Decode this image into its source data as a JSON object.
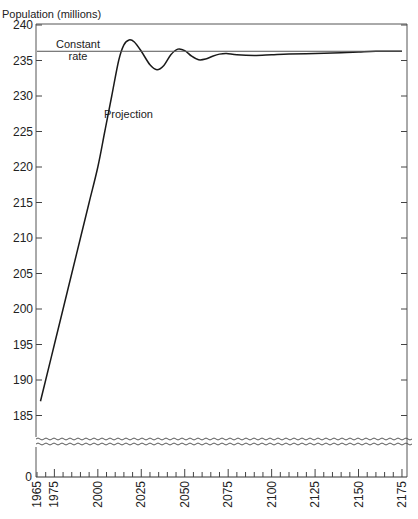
{
  "chart_data": {
    "type": "line",
    "title": "",
    "xlabel": "",
    "ylabel": "Population (millions)",
    "xlim": [
      1965,
      2180
    ],
    "ylim": [
      183,
      240
    ],
    "axis_break": {
      "between": [
        0,
        183
      ],
      "lower_tick_label": "0"
    },
    "y_ticks": [
      185,
      190,
      195,
      200,
      205,
      210,
      215,
      220,
      225,
      230,
      235,
      240
    ],
    "x_ticks": [
      1965,
      1975,
      2000,
      2025,
      2050,
      2075,
      2100,
      2125,
      2150,
      2175
    ],
    "x_minor_tick_step": 5,
    "grid": false,
    "legend": null,
    "series": [
      {
        "name": "Projection",
        "x": [
          1967,
          1970,
          1975,
          1980,
          1985,
          1990,
          1995,
          2000,
          2004,
          2008,
          2012,
          2015,
          2018,
          2021,
          2025,
          2030,
          2034,
          2038,
          2042,
          2046,
          2050,
          2054,
          2058,
          2062,
          2066,
          2070,
          2074,
          2080,
          2090,
          2100,
          2110,
          2125,
          2140,
          2150,
          2160,
          2175
        ],
        "values": [
          187.0,
          190.0,
          195.0,
          200.0,
          205.0,
          210.0,
          215.0,
          220.0,
          225.0,
          230.0,
          235.0,
          237.2,
          237.9,
          237.6,
          236.3,
          234.4,
          233.7,
          234.3,
          235.8,
          236.6,
          236.4,
          235.6,
          235.1,
          235.2,
          235.6,
          235.9,
          236.0,
          235.8,
          235.7,
          235.8,
          235.9,
          236.0,
          236.1,
          236.2,
          236.3,
          236.3
        ]
      },
      {
        "name": "Constant rate",
        "x": [
          1965,
          2175
        ],
        "values": [
          236.3,
          236.3
        ]
      }
    ],
    "annotations": [
      {
        "text": "Constant rate",
        "x": 1975,
        "y": 236.3
      },
      {
        "text": "Projection",
        "x": 2005,
        "y": 227
      }
    ]
  },
  "labels": {
    "ylabel": "Population (millions)",
    "constant_line1": "Constant",
    "constant_line2": "rate",
    "projection": "Projection",
    "zero": "0"
  }
}
